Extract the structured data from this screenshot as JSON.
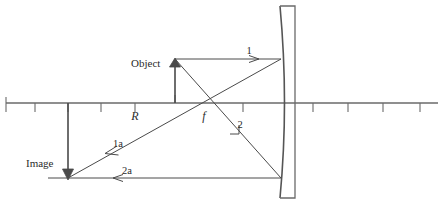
{
  "diagram": {
    "colors": {
      "line": "#4a4a4a",
      "axis": "#6a6a6a",
      "mirror": "#555555",
      "background": "#ffffff",
      "text": "#2b2b2b"
    },
    "labels": {
      "object": "Object",
      "image": "Image",
      "focal_point": "f",
      "radius_of_curvature": "R",
      "ray_incident_parallel": "1",
      "ray_reflected_parallel": "1a",
      "ray_incident_through_focus": "2",
      "ray_reflected_through_focus": "2a"
    },
    "geometry": {
      "axis_y": 103,
      "axis_x_start": 6,
      "axis_x_end": 438,
      "axis_ticks_x": [
        6,
        35,
        68,
        101,
        135,
        175,
        207,
        243,
        283,
        313,
        348,
        383,
        420
      ],
      "tick_height": 9,
      "mirror_vertex_x": 283,
      "mirror_back_x": 295,
      "mirror_top_y": 6,
      "mirror_bottom_y": 198,
      "mirror_bulge": 9,
      "focal_point_x": 207,
      "focal_point_y": 103,
      "center_of_curvature_x": 135,
      "object_base_x": 175,
      "object_base_y": 103,
      "object_tip_y": 60,
      "image_base_x": 68,
      "image_base_y": 103,
      "image_tip_y": 178
    }
  }
}
